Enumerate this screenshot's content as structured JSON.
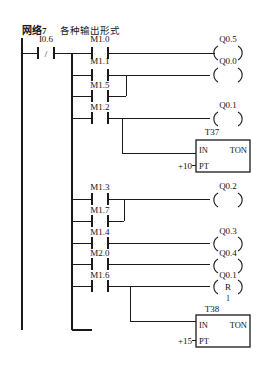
{
  "header": {
    "network_label": "网络",
    "network_number": "7",
    "description": "各种输出形式"
  },
  "diagram": {
    "type": "plc-ladder-diagram",
    "left_rail": true,
    "input_contact": {
      "address": "I0.6",
      "kind": "normally-closed"
    },
    "contacts": [
      {
        "id": "c0",
        "address": "M1.0",
        "kind": "normally-open",
        "row": 1
      },
      {
        "id": "c1",
        "address": "M1.1",
        "kind": "normally-open",
        "row": 2
      },
      {
        "id": "c2",
        "address": "M1.5",
        "kind": "normally-open",
        "row": 3
      },
      {
        "id": "c3",
        "address": "M1.2",
        "kind": "normally-open",
        "row": 4
      },
      {
        "id": "c4",
        "address": "M1.3",
        "kind": "normally-open",
        "row": 6
      },
      {
        "id": "c5",
        "address": "M1.7",
        "kind": "normally-open",
        "row": 7
      },
      {
        "id": "c6",
        "address": "M1.4",
        "kind": "normally-open",
        "row": 8
      },
      {
        "id": "c7",
        "address": "M2.0",
        "kind": "normally-open",
        "row": 9
      },
      {
        "id": "c8",
        "address": "M1.6",
        "kind": "normally-open",
        "row": 10
      }
    ],
    "coils": [
      {
        "id": "o0",
        "address": "Q0.5",
        "kind": "output",
        "symbol": ""
      },
      {
        "id": "o1",
        "address": "Q0.0",
        "kind": "output",
        "symbol": ""
      },
      {
        "id": "o2",
        "address": "Q0.1",
        "kind": "output",
        "symbol": ""
      },
      {
        "id": "o3",
        "address": "Q0.2",
        "kind": "output",
        "symbol": ""
      },
      {
        "id": "o4",
        "address": "Q0.3",
        "kind": "output",
        "symbol": ""
      },
      {
        "id": "o5",
        "address": "Q0.4",
        "kind": "output",
        "symbol": ""
      },
      {
        "id": "o6",
        "address": "Q0.1",
        "kind": "reset",
        "symbol": "R",
        "count": "1"
      }
    ],
    "timers": [
      {
        "id": "t37",
        "name": "T37",
        "in_label": "IN",
        "type_label": "TON",
        "pt_label": "PT",
        "preset": "+10"
      },
      {
        "id": "t38",
        "name": "T38",
        "in_label": "IN",
        "type_label": "TON",
        "pt_label": "PT",
        "preset": "+15"
      }
    ]
  }
}
